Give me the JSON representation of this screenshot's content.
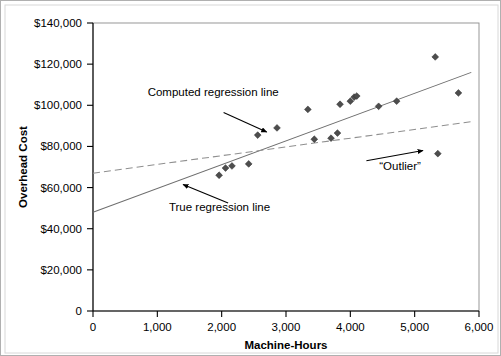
{
  "chart_data": {
    "type": "scatter",
    "title": "",
    "xlabel": "Machine-Hours",
    "ylabel": "Overhead Cost",
    "xlim": [
      0,
      6000
    ],
    "ylim": [
      0,
      140000
    ],
    "grid": false,
    "legend": "none",
    "x_ticks": [
      "0",
      "1,000",
      "2,000",
      "3,000",
      "4,000",
      "5,000",
      "6,000"
    ],
    "x_tick_values": [
      0,
      1000,
      2000,
      3000,
      4000,
      5000,
      6000
    ],
    "y_ticks": [
      "0",
      "$20,000",
      "$40,000",
      "$60,000",
      "$80,000",
      "$100,000",
      "$120,000",
      "$140,000"
    ],
    "y_tick_values": [
      0,
      20000,
      40000,
      60000,
      80000,
      100000,
      120000,
      140000
    ],
    "series": [
      {
        "name": "Observations",
        "marker": "diamond",
        "color": "#4d4d4d",
        "points": [
          {
            "x": 1960,
            "y": 66000
          },
          {
            "x": 2060,
            "y": 69500
          },
          {
            "x": 2160,
            "y": 70500
          },
          {
            "x": 2420,
            "y": 71500
          },
          {
            "x": 2560,
            "y": 85500
          },
          {
            "x": 2860,
            "y": 89000
          },
          {
            "x": 3340,
            "y": 98000
          },
          {
            "x": 3440,
            "y": 83500
          },
          {
            "x": 3700,
            "y": 84000
          },
          {
            "x": 3800,
            "y": 86500
          },
          {
            "x": 3840,
            "y": 100500
          },
          {
            "x": 4000,
            "y": 102000
          },
          {
            "x": 4060,
            "y": 104000
          },
          {
            "x": 4100,
            "y": 104500
          },
          {
            "x": 4440,
            "y": 99500
          },
          {
            "x": 4720,
            "y": 102000
          },
          {
            "x": 5320,
            "y": 123500
          },
          {
            "x": 5360,
            "y": 76500
          },
          {
            "x": 5680,
            "y": 106000
          }
        ]
      }
    ],
    "trend_lines": [
      {
        "name": "True regression line",
        "style": "solid",
        "color": "#6e6e6e",
        "x0": 0,
        "y0": 48000,
        "x1": 5880,
        "y1": 116000
      },
      {
        "name": "Computed regression line",
        "style": "dashed",
        "color": "#8f8f8f",
        "x0": 0,
        "y0": 67000,
        "x1": 5880,
        "y1": 92000
      }
    ],
    "annotations": [
      {
        "id": "computed-regression-annotation",
        "text": "Computed regression line",
        "text_x": 850,
        "text_y": 104500,
        "arrow_from_x": 2030,
        "arrow_from_y": 96500,
        "arrow_to_x": 2700,
        "arrow_to_y": 87000
      },
      {
        "id": "true-regression-annotation",
        "text": "True regression line",
        "text_x": 1180,
        "text_y": 48500,
        "arrow_from_x": 2100,
        "arrow_from_y": 52500,
        "arrow_to_x": 1400,
        "arrow_to_y": 61500
      },
      {
        "id": "outlier-annotation",
        "text": "“Outlier”",
        "text_x": 4450,
        "text_y": 68500,
        "arrow_from_x": 4250,
        "arrow_from_y": 73000,
        "arrow_to_x": 5130,
        "arrow_to_y": 78000
      }
    ]
  }
}
